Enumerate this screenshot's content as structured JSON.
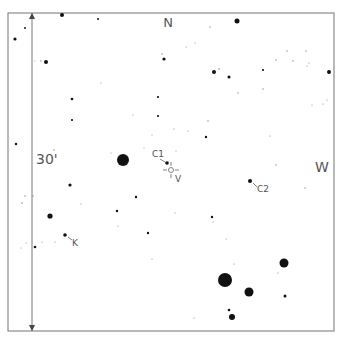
{
  "chart": {
    "frame": {
      "x": 8,
      "y": 13,
      "w": 326,
      "h": 318,
      "stroke": "#8a8a8a"
    },
    "scale_bar": {
      "x": 32,
      "y1": 13,
      "y2": 331,
      "label": "30'",
      "label_x": 36,
      "label_y": 164
    },
    "directions": {
      "north": {
        "label": "N",
        "x": 168,
        "y": 27
      },
      "west": {
        "label": "W",
        "x": 322,
        "y": 172
      }
    },
    "target": {
      "label": "V",
      "x": 171,
      "y": 170,
      "circle_r": 2.5,
      "color": "#666666",
      "label_x": 175,
      "label_y": 182
    },
    "comparison_stars": [
      {
        "label": "C1",
        "x": 167,
        "y": 163,
        "r": 1.8,
        "label_x": 152,
        "label_y": 157,
        "leader": [
          160,
          159,
          165,
          162
        ]
      },
      {
        "label": "C2",
        "x": 250,
        "y": 181,
        "r": 2,
        "label_x": 257,
        "label_y": 192,
        "leader": [
          253,
          183,
          257,
          187
        ]
      },
      {
        "label": "K",
        "x": 65,
        "y": 235,
        "r": 1.8,
        "label_x": 72,
        "label_y": 246,
        "leader": [
          68,
          237,
          72,
          240
        ]
      }
    ],
    "stars": [
      {
        "x": 62,
        "y": 15,
        "r": 2
      },
      {
        "x": 98,
        "y": 19,
        "r": 1
      },
      {
        "x": 237,
        "y": 21,
        "r": 2.5
      },
      {
        "x": 25,
        "y": 28,
        "r": 1
      },
      {
        "x": 15,
        "y": 39,
        "r": 1.6
      },
      {
        "x": 210,
        "y": 27,
        "r": 0.7
      },
      {
        "x": 287,
        "y": 51,
        "r": 0.7
      },
      {
        "x": 306,
        "y": 51,
        "r": 0.7
      },
      {
        "x": 186,
        "y": 47,
        "r": 0.6
      },
      {
        "x": 195,
        "y": 43,
        "r": 0.6
      },
      {
        "x": 162,
        "y": 54,
        "r": 0.7
      },
      {
        "x": 164,
        "y": 59,
        "r": 1.6
      },
      {
        "x": 41,
        "y": 61,
        "r": 0.7
      },
      {
        "x": 35,
        "y": 61,
        "r": 0.5
      },
      {
        "x": 46,
        "y": 62,
        "r": 2
      },
      {
        "x": 276,
        "y": 60,
        "r": 0.7
      },
      {
        "x": 293,
        "y": 61,
        "r": 0.7
      },
      {
        "x": 309,
        "y": 63,
        "r": 0.6
      },
      {
        "x": 307,
        "y": 66,
        "r": 0.6
      },
      {
        "x": 263,
        "y": 70,
        "r": 1.1
      },
      {
        "x": 214,
        "y": 72,
        "r": 2
      },
      {
        "x": 219,
        "y": 69,
        "r": 0.8
      },
      {
        "x": 229,
        "y": 77,
        "r": 1.5
      },
      {
        "x": 329,
        "y": 72,
        "r": 2
      },
      {
        "x": 101,
        "y": 83,
        "r": 0.6
      },
      {
        "x": 263,
        "y": 89,
        "r": 0.7
      },
      {
        "x": 238,
        "y": 93,
        "r": 0.7
      },
      {
        "x": 72,
        "y": 99,
        "r": 1.3
      },
      {
        "x": 158,
        "y": 97,
        "r": 1.1
      },
      {
        "x": 327,
        "y": 100,
        "r": 0.6
      },
      {
        "x": 323,
        "y": 104,
        "r": 0.6
      },
      {
        "x": 312,
        "y": 105,
        "r": 0.6
      },
      {
        "x": 133,
        "y": 115,
        "r": 0.6
      },
      {
        "x": 158,
        "y": 116,
        "r": 1.1
      },
      {
        "x": 72,
        "y": 120,
        "r": 1.1
      },
      {
        "x": 208,
        "y": 121,
        "r": 0.7
      },
      {
        "x": 174,
        "y": 129,
        "r": 0.6
      },
      {
        "x": 188,
        "y": 131,
        "r": 0.6
      },
      {
        "x": 152,
        "y": 135,
        "r": 0.5
      },
      {
        "x": 206,
        "y": 137,
        "r": 1.2
      },
      {
        "x": 270,
        "y": 136,
        "r": 0.6
      },
      {
        "x": 16,
        "y": 144,
        "r": 1.2
      },
      {
        "x": 144,
        "y": 148,
        "r": 0.5
      },
      {
        "x": 54,
        "y": 150,
        "r": 0.7
      },
      {
        "x": 176,
        "y": 151,
        "r": 0.5
      },
      {
        "x": 111,
        "y": 153,
        "r": 0.6
      },
      {
        "x": 123,
        "y": 160,
        "r": 6
      },
      {
        "x": 276,
        "y": 165,
        "r": 0.7
      },
      {
        "x": 70,
        "y": 185,
        "r": 1.6
      },
      {
        "x": 305,
        "y": 188,
        "r": 0.7
      },
      {
        "x": 25,
        "y": 196,
        "r": 0.7
      },
      {
        "x": 33,
        "y": 196,
        "r": 0.7
      },
      {
        "x": 136,
        "y": 197,
        "r": 1.2
      },
      {
        "x": 22,
        "y": 203,
        "r": 0.8
      },
      {
        "x": 81,
        "y": 204,
        "r": 0.6
      },
      {
        "x": 117,
        "y": 211,
        "r": 1.2
      },
      {
        "x": 175,
        "y": 213,
        "r": 0.6
      },
      {
        "x": 50,
        "y": 216,
        "r": 2.6
      },
      {
        "x": 212,
        "y": 217,
        "r": 1.2
      },
      {
        "x": 213,
        "y": 222,
        "r": 0.6
      },
      {
        "x": 118,
        "y": 226,
        "r": 0.6
      },
      {
        "x": 148,
        "y": 233,
        "r": 1.2
      },
      {
        "x": 226,
        "y": 239,
        "r": 0.6
      },
      {
        "x": 26,
        "y": 243,
        "r": 0.5
      },
      {
        "x": 42,
        "y": 242,
        "r": 0.6
      },
      {
        "x": 55,
        "y": 242,
        "r": 0.6
      },
      {
        "x": 21,
        "y": 248,
        "r": 0.5
      },
      {
        "x": 35,
        "y": 247,
        "r": 1.3
      },
      {
        "x": 152,
        "y": 259,
        "r": 0.6
      },
      {
        "x": 234,
        "y": 264,
        "r": 0.6
      },
      {
        "x": 284,
        "y": 263,
        "r": 4.5
      },
      {
        "x": 278,
        "y": 273,
        "r": 0.6
      },
      {
        "x": 225,
        "y": 280,
        "r": 7
      },
      {
        "x": 249,
        "y": 292,
        "r": 4.5
      },
      {
        "x": 285,
        "y": 296,
        "r": 1.5
      },
      {
        "x": 229,
        "y": 310,
        "r": 1.3
      },
      {
        "x": 232,
        "y": 317,
        "r": 3
      },
      {
        "x": 194,
        "y": 318,
        "r": 0.6
      }
    ]
  }
}
